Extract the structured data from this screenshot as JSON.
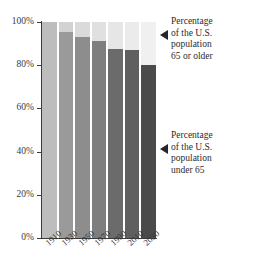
{
  "chart_data": {
    "type": "bar",
    "title": "",
    "subtitle": "",
    "xlabel": "",
    "ylabel": "",
    "stacked": true,
    "stack_total": 100,
    "grid": false,
    "legend_position": "right",
    "ylim": [
      0,
      100
    ],
    "ytick_labels": [
      "0%",
      "20%",
      "40%",
      "60%",
      "80%",
      "100%"
    ],
    "ytick_values": [
      0,
      20,
      40,
      60,
      80,
      100
    ],
    "categories": [
      "1910",
      "1930",
      "1950",
      "1970",
      "1990",
      "2010",
      "2030"
    ],
    "series": [
      {
        "name": "Percentage of the U.S. population under 65",
        "values": [
          100,
          95.5,
          93,
          91,
          87.5,
          87,
          80
        ],
        "color": "#6f6f6f"
      },
      {
        "name": "Percentage of the U.S. population 65 or older",
        "values": [
          0,
          4.5,
          7,
          9,
          12.5,
          13,
          20
        ],
        "color": "#dcdcdc"
      }
    ],
    "bar_colors_under65": [
      "#bdbdbd",
      "#9a9a9a",
      "#8d8d8d",
      "#7e7e7e",
      "#6b6b6b",
      "#5f5f5f",
      "#4a4a4a"
    ],
    "bar_colors_over65": [
      "#c9c9c9",
      "#d2d2d2",
      "#dadada",
      "#e0e0e0",
      "#e6e6e6",
      "#ebebeb",
      "#f0f0f0"
    ],
    "annotations": [
      {
        "id": "older",
        "text": "Percentage\nof the U.S.\npopulation\n65 or older",
        "marker": "left-triangle",
        "target": "top-light-segment"
      },
      {
        "id": "under",
        "text": "Percentage\nof the U.S.\npopulation\nunder 65",
        "marker": "left-triangle",
        "target": "bottom-dark-segment"
      }
    ]
  },
  "colors": {
    "axis": "#3a3a3a",
    "text": "#2b2b2b",
    "background": "#ffffff",
    "marker": "#262626"
  }
}
